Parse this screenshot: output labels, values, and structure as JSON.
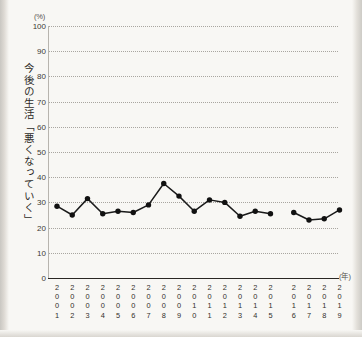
{
  "axis": {
    "y_unit": "(%)",
    "x_unit": "(年)",
    "y_caption": "今後の生活「悪くなっていく」",
    "y_ticks": [
      "100",
      "90",
      "80",
      "70",
      "60",
      "50",
      "40",
      "30",
      "20",
      "10",
      "0"
    ]
  },
  "colors": {
    "line": "#1a1a1a",
    "marker": "#111111",
    "grid": "#a9a6a0",
    "axis": "#2a2723",
    "text": "#332f2b",
    "background": "#f8f7f4"
  },
  "chart_data": {
    "type": "line",
    "title": "",
    "xlabel": "(年)",
    "ylabel": "今後の生活「悪くなっていく」",
    "yunit": "(%)",
    "ylim": [
      0,
      100
    ],
    "ytick_step": 10,
    "grid": true,
    "legend": "none",
    "categories": [
      "2001",
      "2002",
      "2003",
      "2004",
      "2005",
      "2006",
      "2007",
      "2008",
      "2009",
      "2010",
      "2011",
      "2012",
      "2013",
      "2014",
      "2015",
      "2016",
      "2017",
      "2018",
      "2019"
    ],
    "values": [
      28.5,
      25.0,
      31.5,
      25.5,
      26.5,
      26.0,
      29.0,
      37.5,
      32.5,
      26.5,
      31.0,
      30.0,
      24.5,
      26.5,
      25.5,
      26.0,
      23.0,
      23.5,
      27.0
    ],
    "series_breaks": [
      [
        0,
        14
      ],
      [
        15,
        18
      ]
    ],
    "annotations": []
  }
}
